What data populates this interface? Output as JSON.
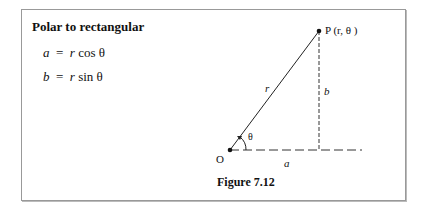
{
  "section_title": "Polar to rectangular",
  "equations": [
    {
      "lhs": "a",
      "eq": "=",
      "var": "r",
      "fn": "cos θ"
    },
    {
      "lhs": "b",
      "eq": "=",
      "var": "r",
      "fn": "sin θ"
    }
  ],
  "figure": {
    "point_label": "P (r, θ )",
    "origin_label": "O",
    "radius_label": "r",
    "angle_label": "θ",
    "horizontal_label": "a",
    "vertical_label": "b",
    "caption": "Figure 7.12"
  }
}
